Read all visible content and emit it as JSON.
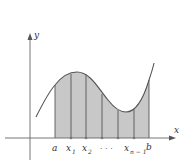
{
  "diagram": {
    "axes": {
      "x_label": "x",
      "y_label": "y"
    },
    "tick_labels": {
      "a": "a",
      "x1": "x",
      "x1_sub": "1",
      "x2": "x",
      "x2_sub": "2",
      "dots": "· · ·",
      "xn1": "x",
      "xn1_sub": "n − 1",
      "b": "b"
    },
    "colors": {
      "fill": "#c8c8c8",
      "curve": "#555555",
      "axis": "#666666"
    }
  }
}
